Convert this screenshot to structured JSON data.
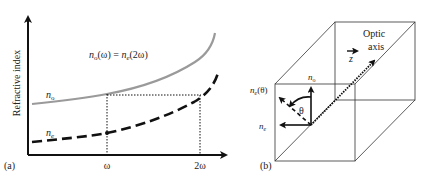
{
  "panel_a": {
    "label": "(a)",
    "y_axis_label": "Refractive index",
    "x_ticks": [
      "ω",
      "2ω"
    ],
    "equation": {
      "n1": "n",
      "sub1": "o",
      "arg1": "(ω) = ",
      "n2": "n",
      "sub2": "e",
      "arg2": "(2ω)"
    },
    "curve_no": {
      "label_n": "n",
      "label_sub": "o",
      "color": "#9a9a9a",
      "style": "solid"
    },
    "curve_ne": {
      "label_n": "n",
      "label_sub": "e",
      "color": "#111111",
      "style": "dashed"
    }
  },
  "panel_b": {
    "label": "(b)",
    "optic_axis_line1": "Optic",
    "optic_axis_line2": "axis",
    "z_label": "z",
    "theta_label": "θ",
    "vec_no": {
      "n": "n",
      "sub": "o"
    },
    "vec_ne": {
      "n": "n",
      "sub": "e"
    },
    "vec_ne_theta": {
      "n": "n",
      "sub": "e",
      "arg": "(θ)"
    }
  },
  "colors": {
    "axis": "#111111",
    "no_curve": "#9a9a9a",
    "ne_curve": "#111111",
    "box": "#333333"
  }
}
